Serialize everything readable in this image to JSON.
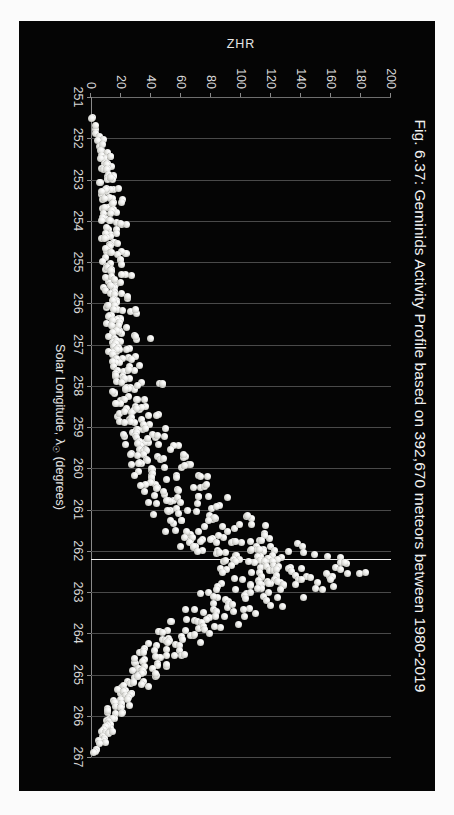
{
  "figure": {
    "title": "Fig. 6.37: Geminids Activity Profile based on 392,670 meteors between 1980-2019",
    "background_color": "#050505",
    "marker_color": "#e8e8e4",
    "peak_line_color": "#efefef"
  },
  "chart_data": {
    "type": "scatter",
    "title": "Fig. 6.37: Geminids Activity Profile based on 392,670 meteors between 1980-2019",
    "xlabel": "Solar Longitude, λ☉ (degrees)",
    "xlabel_text": "Solar Longitude,",
    "xlabel_symbol": "λ",
    "xlabel_subscript": "☉",
    "xlabel_units": "(degrees)",
    "ylabel": "ZHR",
    "xlim": [
      251,
      267
    ],
    "ylim": [
      0,
      200
    ],
    "xticks": [
      251,
      252,
      253,
      254,
      255,
      256,
      257,
      258,
      259,
      260,
      261,
      262,
      263,
      264,
      265,
      266,
      267
    ],
    "yticks": [
      0,
      20,
      40,
      60,
      80,
      100,
      120,
      140,
      160,
      180,
      200
    ],
    "grid": "vertical",
    "legend": "none",
    "annotations": [
      {
        "name": "peak-marker-line",
        "type": "vline",
        "x": 262.2,
        "label": ""
      }
    ],
    "series": [
      {
        "name": "Geminids ZHR",
        "n_meteors": 392670,
        "years": "1980-2019",
        "points": [
          [
            251.52,
            2
          ],
          [
            251.75,
            4
          ],
          [
            251.92,
            3
          ],
          [
            252.05,
            6
          ],
          [
            252.18,
            5
          ],
          [
            252.28,
            9
          ],
          [
            252.36,
            7
          ],
          [
            252.44,
            11
          ],
          [
            252.55,
            8
          ],
          [
            252.62,
            13
          ],
          [
            252.7,
            6
          ],
          [
            252.8,
            10
          ],
          [
            252.88,
            14
          ],
          [
            252.95,
            9
          ],
          [
            253.02,
            12
          ],
          [
            253.1,
            7
          ],
          [
            253.18,
            16
          ],
          [
            253.24,
            11
          ],
          [
            253.32,
            8
          ],
          [
            253.4,
            13
          ],
          [
            253.48,
            10
          ],
          [
            253.56,
            18
          ],
          [
            253.64,
            12
          ],
          [
            253.72,
            9
          ],
          [
            253.8,
            15
          ],
          [
            253.88,
            11
          ],
          [
            253.96,
            7
          ],
          [
            254.04,
            14
          ],
          [
            254.12,
            20
          ],
          [
            254.2,
            10
          ],
          [
            254.28,
            16
          ],
          [
            254.36,
            12
          ],
          [
            254.44,
            8
          ],
          [
            254.52,
            17
          ],
          [
            254.6,
            13
          ],
          [
            254.68,
            11
          ],
          [
            254.76,
            22
          ],
          [
            254.84,
            15
          ],
          [
            254.92,
            9
          ],
          [
            255.0,
            18
          ],
          [
            255.08,
            13
          ],
          [
            255.16,
            11
          ],
          [
            255.24,
            16
          ],
          [
            255.32,
            24
          ],
          [
            255.4,
            12
          ],
          [
            255.48,
            19
          ],
          [
            255.56,
            14
          ],
          [
            255.64,
            10
          ],
          [
            255.72,
            17
          ],
          [
            255.8,
            13
          ],
          [
            255.88,
            21
          ],
          [
            255.96,
            15
          ],
          [
            256.04,
            11
          ],
          [
            256.12,
            18
          ],
          [
            256.2,
            26
          ],
          [
            256.28,
            14
          ],
          [
            256.36,
            20
          ],
          [
            256.44,
            16
          ],
          [
            256.52,
            12
          ],
          [
            256.6,
            23
          ],
          [
            256.68,
            17
          ],
          [
            256.76,
            13
          ],
          [
            256.84,
            35
          ],
          [
            256.92,
            19
          ],
          [
            257.0,
            15
          ],
          [
            257.08,
            22
          ],
          [
            257.16,
            18
          ],
          [
            257.24,
            14
          ],
          [
            257.32,
            26
          ],
          [
            257.4,
            20
          ],
          [
            257.48,
            16
          ],
          [
            257.56,
            29
          ],
          [
            257.64,
            21
          ],
          [
            257.72,
            17
          ],
          [
            257.8,
            24
          ],
          [
            257.88,
            19
          ],
          [
            257.96,
            40
          ],
          [
            258.04,
            27
          ],
          [
            258.12,
            22
          ],
          [
            258.2,
            18
          ],
          [
            258.28,
            31
          ],
          [
            258.36,
            24
          ],
          [
            258.44,
            20
          ],
          [
            258.52,
            34
          ],
          [
            258.6,
            26
          ],
          [
            258.68,
            22
          ],
          [
            258.76,
            38
          ],
          [
            258.84,
            29
          ],
          [
            258.92,
            24
          ],
          [
            259.0,
            42
          ],
          [
            259.08,
            31
          ],
          [
            259.16,
            26
          ],
          [
            259.24,
            46
          ],
          [
            259.32,
            34
          ],
          [
            259.4,
            28
          ],
          [
            259.48,
            50
          ],
          [
            259.56,
            37
          ],
          [
            259.64,
            30
          ],
          [
            259.72,
            55
          ],
          [
            259.8,
            41
          ],
          [
            259.88,
            33
          ],
          [
            259.96,
            60
          ],
          [
            260.04,
            45
          ],
          [
            260.12,
            36
          ],
          [
            260.2,
            66
          ],
          [
            260.28,
            49
          ],
          [
            260.36,
            39
          ],
          [
            260.44,
            72
          ],
          [
            260.52,
            54
          ],
          [
            260.6,
            43
          ],
          [
            260.68,
            78
          ],
          [
            260.76,
            59
          ],
          [
            260.84,
            47
          ],
          [
            260.92,
            85
          ],
          [
            261.0,
            64
          ],
          [
            261.08,
            51
          ],
          [
            261.16,
            92
          ],
          [
            261.24,
            70
          ],
          [
            261.32,
            56
          ],
          [
            261.4,
            99
          ],
          [
            261.48,
            76
          ],
          [
            261.56,
            61
          ],
          [
            261.64,
            106
          ],
          [
            261.68,
            83
          ],
          [
            261.72,
            66
          ],
          [
            261.76,
            113
          ],
          [
            261.8,
            90
          ],
          [
            261.84,
            72
          ],
          [
            261.88,
            120
          ],
          [
            261.92,
            97
          ],
          [
            261.96,
            78
          ],
          [
            262.0,
            127
          ],
          [
            262.04,
            104
          ],
          [
            262.08,
            85
          ],
          [
            262.12,
            134
          ],
          [
            262.16,
            111
          ],
          [
            262.2,
            141
          ],
          [
            262.24,
            118
          ],
          [
            262.28,
            95
          ],
          [
            262.32,
            148
          ],
          [
            262.36,
            125
          ],
          [
            262.4,
            102
          ],
          [
            262.44,
            155
          ],
          [
            262.48,
            132
          ],
          [
            262.52,
            109
          ],
          [
            262.56,
            160
          ],
          [
            262.6,
            138
          ],
          [
            262.64,
            115
          ],
          [
            262.68,
            152
          ],
          [
            262.72,
            128
          ],
          [
            262.76,
            106
          ],
          [
            262.8,
            144
          ],
          [
            262.84,
            120
          ],
          [
            262.88,
            98
          ],
          [
            262.92,
            136
          ],
          [
            262.96,
            112
          ],
          [
            263.0,
            90
          ],
          [
            263.08,
            124
          ],
          [
            263.16,
            101
          ],
          [
            263.24,
            82
          ],
          [
            263.32,
            110
          ],
          [
            263.4,
            88
          ],
          [
            263.48,
            72
          ],
          [
            263.56,
            96
          ],
          [
            263.64,
            77
          ],
          [
            263.72,
            63
          ],
          [
            263.8,
            84
          ],
          [
            263.88,
            67
          ],
          [
            263.96,
            55
          ],
          [
            264.04,
            72
          ],
          [
            264.12,
            58
          ],
          [
            264.2,
            47
          ],
          [
            264.28,
            62
          ],
          [
            264.36,
            50
          ],
          [
            264.44,
            40
          ],
          [
            264.52,
            53
          ],
          [
            264.6,
            43
          ],
          [
            264.68,
            34
          ],
          [
            264.76,
            45
          ],
          [
            264.84,
            36
          ],
          [
            264.92,
            29
          ],
          [
            265.0,
            38
          ],
          [
            265.08,
            30
          ],
          [
            265.16,
            24
          ],
          [
            265.24,
            32
          ],
          [
            265.32,
            25
          ],
          [
            265.4,
            20
          ],
          [
            265.48,
            27
          ],
          [
            265.56,
            21
          ],
          [
            265.64,
            16
          ],
          [
            265.72,
            22
          ],
          [
            265.8,
            17
          ],
          [
            265.88,
            13
          ],
          [
            265.96,
            18
          ],
          [
            266.04,
            14
          ],
          [
            266.12,
            10
          ],
          [
            266.2,
            15
          ],
          [
            266.28,
            11
          ],
          [
            266.36,
            8
          ],
          [
            266.44,
            12
          ],
          [
            266.52,
            9
          ],
          [
            266.6,
            6
          ],
          [
            266.7,
            8
          ],
          [
            266.8,
            5
          ],
          [
            266.9,
            4
          ]
        ]
      }
    ]
  }
}
